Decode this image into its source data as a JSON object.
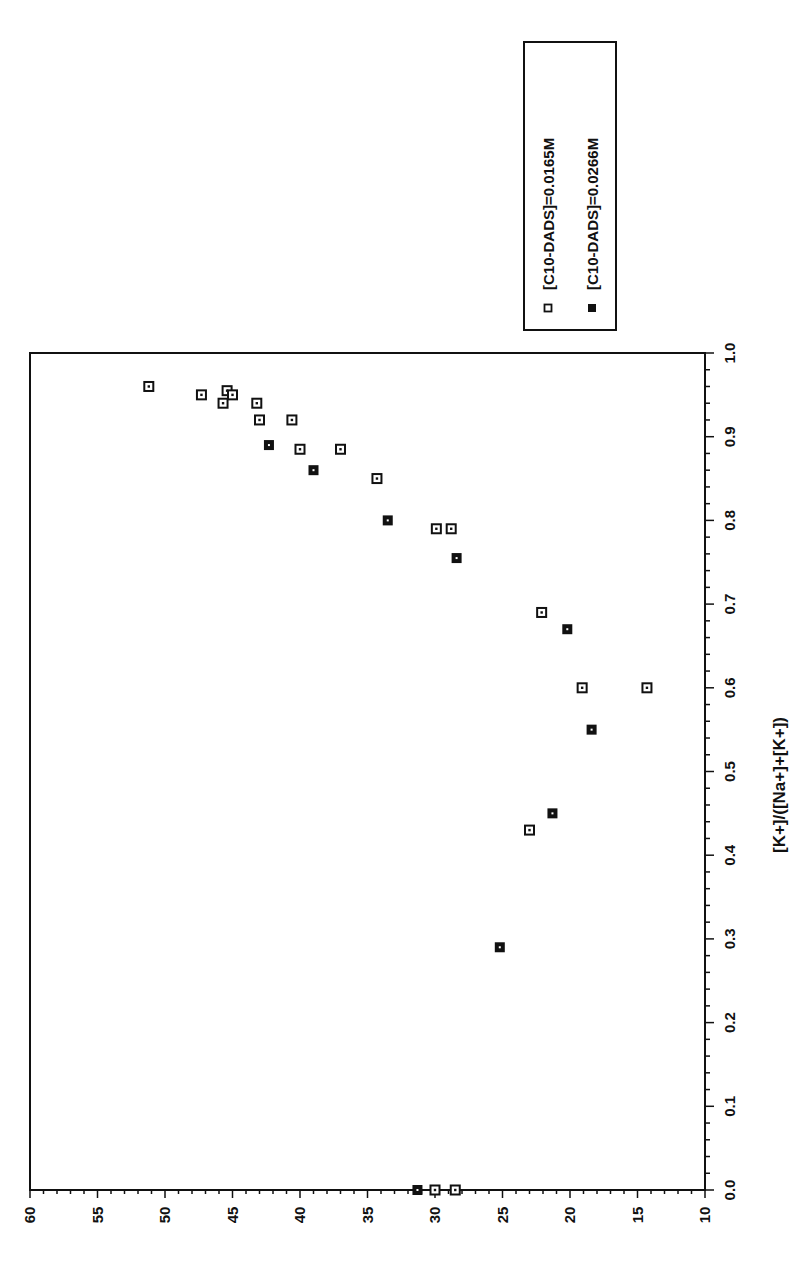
{
  "chart_data": {
    "type": "scatter",
    "title": "",
    "xlabel": "[K+]/([Na+]+[K+])",
    "ylabel": "",
    "xlim": [
      0.0,
      1.0
    ],
    "ylim": [
      10,
      60
    ],
    "x_ticks": [
      "0.0",
      "0.1",
      "0.2",
      "0.3",
      "0.4",
      "0.5",
      "0.6",
      "0.7",
      "0.8",
      "0.9",
      "1.0"
    ],
    "y_ticks": [
      "60",
      "55",
      "50",
      "45",
      "40",
      "35",
      "30",
      "25",
      "20",
      "15",
      "10"
    ],
    "grid": false,
    "legend_position": "upper-right (rotated)",
    "orientation": "rotated 90 degrees counter-clockwise",
    "series": [
      {
        "name": "[C10-DADS]=0.0165M",
        "marker": "open-square",
        "points": [
          [
            0.96,
            51.2
          ],
          [
            0.95,
            47.3
          ],
          [
            0.94,
            45.7
          ],
          [
            0.955,
            45.4
          ],
          [
            0.95,
            45.0
          ],
          [
            0.94,
            43.2
          ],
          [
            0.92,
            43.0
          ],
          [
            0.92,
            40.6
          ],
          [
            0.885,
            40.0
          ],
          [
            0.885,
            37.0
          ],
          [
            0.85,
            34.3
          ],
          [
            0.79,
            29.9
          ],
          [
            0.79,
            28.8
          ],
          [
            0.69,
            22.1
          ],
          [
            0.6,
            19.1
          ],
          [
            0.6,
            14.3
          ],
          [
            0.43,
            23.0
          ],
          [
            0.0,
            30.0
          ],
          [
            0.0,
            28.5
          ]
        ]
      },
      {
        "name": "[C10-DADS]=0.0266M",
        "marker": "filled-square",
        "points": [
          [
            0.89,
            42.3
          ],
          [
            0.86,
            39.0
          ],
          [
            0.8,
            33.5
          ],
          [
            0.755,
            28.4
          ],
          [
            0.67,
            20.2
          ],
          [
            0.55,
            18.4
          ],
          [
            0.45,
            21.3
          ],
          [
            0.29,
            25.2
          ],
          [
            0.0,
            31.3
          ]
        ]
      }
    ]
  },
  "legend": {
    "items": [
      "[C10-DADS]=0.0165M",
      "[C10-DADS]=0.0266M"
    ]
  },
  "colors": {
    "ink": "#111111",
    "background": "#ffffff"
  }
}
